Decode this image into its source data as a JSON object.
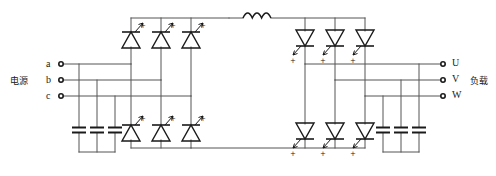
{
  "diagram": {
    "type": "circuit-schematic",
    "line_color": "#555555",
    "device_color": "#1a1a1a",
    "background": "#ffffff"
  },
  "source": {
    "label": "电源",
    "terminals": [
      {
        "name": "a",
        "label": "a"
      },
      {
        "name": "b",
        "label": "b"
      },
      {
        "name": "c",
        "label": "c"
      }
    ]
  },
  "load": {
    "label": "负载",
    "terminals": [
      {
        "name": "U",
        "label": "U"
      },
      {
        "name": "V",
        "label": "V"
      },
      {
        "name": "W",
        "label": "W"
      }
    ]
  },
  "components": {
    "input_capacitors": {
      "name": "input-capacitor-bank",
      "count": 3
    },
    "output_capacitors": {
      "name": "output-capacitor-bank",
      "count": 3
    },
    "dc_link_inductor": {
      "name": "dc-link-inductor",
      "coils": 3
    },
    "rectifier_bridge": {
      "name": "thyristor-rectifier-bridge",
      "orientation": "up",
      "upper_count": 3,
      "lower_count": 3,
      "gate_marks": [
        "+",
        "+",
        "+",
        "+",
        "+",
        "+"
      ]
    },
    "inverter_bridge": {
      "name": "thyristor-inverter-bridge",
      "orientation": "down",
      "upper_count": 3,
      "lower_count": 3,
      "gate_marks": [
        "+",
        "+",
        "+",
        "+",
        "+",
        "+"
      ]
    }
  }
}
